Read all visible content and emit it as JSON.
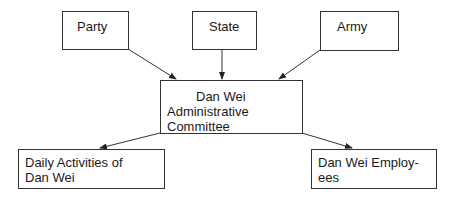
{
  "diagram": {
    "type": "flowchart",
    "nodes": {
      "party": {
        "label": "Party"
      },
      "state": {
        "label": "State"
      },
      "army": {
        "label": "Army"
      },
      "center": {
        "line1": "Dan Wei",
        "line2": "Administrative",
        "line3": "Committee"
      },
      "daily": {
        "line1": "Daily Activities of",
        "line2": "Dan Wei"
      },
      "employees": {
        "line1": "Dan Wei Employ-",
        "line2": "ees"
      }
    },
    "edges": [
      {
        "from": "Party",
        "to": "Dan Wei Administrative Committee"
      },
      {
        "from": "State",
        "to": "Dan Wei Administrative Committee"
      },
      {
        "from": "Army",
        "to": "Dan Wei Administrative Committee"
      },
      {
        "from": "Dan Wei Administrative Committee",
        "to": "Daily Activities of Dan Wei"
      },
      {
        "from": "Dan Wei Administrative Committee",
        "to": "Dan Wei Employees"
      }
    ],
    "colors": {
      "line": "#333333",
      "background": "#ffffff",
      "text": "#1a1a1a"
    }
  }
}
